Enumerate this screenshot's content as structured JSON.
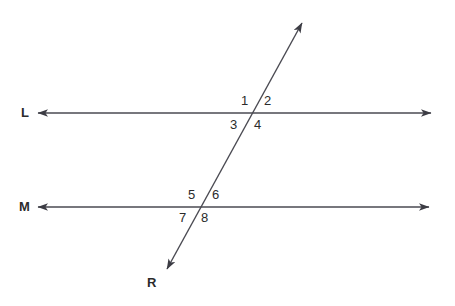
{
  "figure": {
    "type": "geometry-diagram",
    "background_color": "#ffffff",
    "stroke_color": "#4a4a52",
    "text_color": "#2b2b2b",
    "stroke_width": 1.4
  },
  "lines": [
    {
      "name": "line-L",
      "label": "L",
      "label_x": 21,
      "label_y": 106,
      "x1": 38,
      "y1": 113,
      "x2": 431,
      "y2": 113,
      "arrow_start": true,
      "arrow_end": true
    },
    {
      "name": "line-M",
      "label": "M",
      "label_x": 19,
      "label_y": 200,
      "x1": 38,
      "y1": 207,
      "x2": 429,
      "y2": 207,
      "arrow_start": true,
      "arrow_end": true
    },
    {
      "name": "transversal-R",
      "label": "R",
      "label_x": 147,
      "label_y": 276,
      "x1": 302,
      "y1": 23,
      "x2": 167,
      "y2": 269,
      "arrow_start": true,
      "arrow_end": true
    }
  ],
  "intersections": [
    {
      "name": "intersection-upper",
      "x": 252,
      "y": 113,
      "line": "L"
    },
    {
      "name": "intersection-lower",
      "x": 201,
      "y": 207,
      "line": "M"
    }
  ],
  "angles": [
    {
      "id": "1",
      "label": "1",
      "x": 241,
      "y": 94,
      "position": "upper-left",
      "intersection": "upper"
    },
    {
      "id": "2",
      "label": "2",
      "x": 264,
      "y": 94,
      "position": "upper-right",
      "intersection": "upper"
    },
    {
      "id": "3",
      "label": "3",
      "x": 230,
      "y": 118,
      "position": "lower-left",
      "intersection": "upper"
    },
    {
      "id": "4",
      "label": "4",
      "x": 254,
      "y": 118,
      "position": "lower-right",
      "intersection": "upper"
    },
    {
      "id": "5",
      "label": "5",
      "x": 188,
      "y": 188,
      "position": "upper-left",
      "intersection": "lower"
    },
    {
      "id": "6",
      "label": "6",
      "x": 212,
      "y": 188,
      "position": "upper-right",
      "intersection": "lower"
    },
    {
      "id": "7",
      "label": "7",
      "x": 179,
      "y": 211,
      "position": "lower-left",
      "intersection": "lower"
    },
    {
      "id": "8",
      "label": "8",
      "x": 201,
      "y": 211,
      "position": "lower-right",
      "intersection": "lower"
    }
  ]
}
